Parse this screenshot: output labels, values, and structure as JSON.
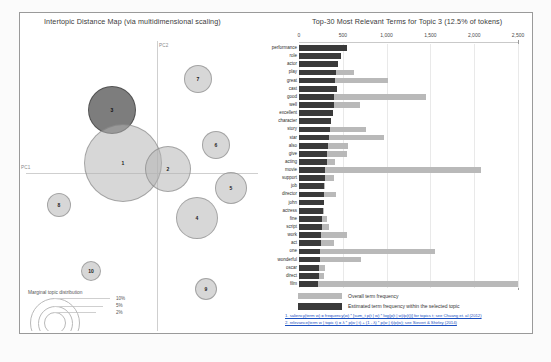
{
  "left_panel": {
    "title": "Intertopic Distance Map (via multidimensional scaling)",
    "axis_x_label": "PC1",
    "axis_y_label": "PC2",
    "legend_caption": "Marginal topic distribution",
    "legend_sizes": [
      "2%",
      "5%",
      "10%"
    ],
    "topics": [
      {
        "id": "1",
        "label": "1",
        "x": 103,
        "y": 150,
        "r": 39,
        "selected": false
      },
      {
        "id": "2",
        "label": "2",
        "x": 148,
        "y": 156,
        "r": 23,
        "selected": false
      },
      {
        "id": "3",
        "label": "3",
        "x": 92,
        "y": 97,
        "r": 24,
        "selected": true
      },
      {
        "id": "4",
        "label": "4",
        "x": 177,
        "y": 205,
        "r": 21,
        "selected": false
      },
      {
        "id": "5",
        "label": "5",
        "x": 211,
        "y": 175,
        "r": 16,
        "selected": false
      },
      {
        "id": "6",
        "label": "6",
        "x": 196,
        "y": 132,
        "r": 14,
        "selected": false
      },
      {
        "id": "7",
        "label": "7",
        "x": 178,
        "y": 66,
        "r": 14,
        "selected": false
      },
      {
        "id": "8",
        "label": "8",
        "x": 39,
        "y": 192,
        "r": 12,
        "selected": false
      },
      {
        "id": "9",
        "label": "9",
        "x": 186,
        "y": 276,
        "r": 11,
        "selected": false
      },
      {
        "id": "10",
        "label": "10",
        "x": 71,
        "y": 258,
        "r": 10,
        "selected": false
      }
    ]
  },
  "right_panel": {
    "title": "Top-30 Most Relevant Terms for Topic 3 (12.5% of tokens)",
    "legend": {
      "overall_label": "Overall term frequency",
      "topic_label": "Estimated term frequency within the selected topic"
    },
    "footnotes": [
      "1. saliency(term w) = frequency(w) * [sum_t p(t | w) * log(p(t | w)/p(t))] for topics t; see Chuang et. al (2012)",
      "2. relevance(term w | topic t) = λ * p(w | t) + (1 - λ) * p(w | t)/p(w); see Sievert & Shirley (2014)"
    ],
    "colors": {
      "overall_bar": "#b9b9b9",
      "topic_bar": "#3a3a3a",
      "link": "#1a4fbf"
    }
  },
  "chart_data": {
    "type": "bar",
    "title": "Top-30 Most Relevant Terms for Topic 3 (12.5% of tokens)",
    "orientation": "horizontal",
    "xlabel": "",
    "ylabel": "",
    "xlim": [
      0,
      2500
    ],
    "xticks": [
      0,
      500,
      1000,
      1500,
      2000,
      2500
    ],
    "xtick_labels": [
      "0",
      "500",
      "1,000",
      "1,500",
      "2,000",
      "2,500"
    ],
    "grid": true,
    "legend_position": "bottom",
    "categories": [
      "performance",
      "role",
      "actor",
      "play",
      "great",
      "cast",
      "good",
      "well",
      "excellent",
      "character",
      "story",
      "star",
      "also",
      "give",
      "acting",
      "movie",
      "support",
      "job",
      "director",
      "john",
      "actress",
      "fine",
      "script",
      "work",
      "act",
      "one",
      "wonderful",
      "oscar",
      "direct",
      "film"
    ],
    "series": [
      {
        "name": "Overall term frequency",
        "values": [
          545,
          480,
          440,
          630,
          1020,
          430,
          1450,
          700,
          390,
          360,
          760,
          970,
          560,
          545,
          410,
          2080,
          395,
          300,
          420,
          290,
          290,
          320,
          340,
          545,
          400,
          1550,
          710,
          300,
          290,
          2500
        ]
      },
      {
        "name": "Estimated term frequency within the selected topic",
        "values": [
          545,
          480,
          440,
          420,
          415,
          430,
          400,
          400,
          390,
          360,
          350,
          340,
          330,
          320,
          315,
          300,
          295,
          290,
          285,
          280,
          275,
          265,
          260,
          255,
          250,
          240,
          235,
          230,
          225,
          215
        ]
      }
    ]
  }
}
